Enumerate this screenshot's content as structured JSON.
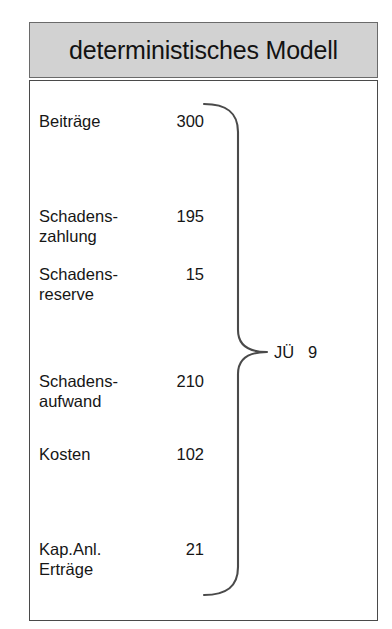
{
  "figure": {
    "title": "deterministisches Modell",
    "colors": {
      "title_bar_bg": "#d2d2d2",
      "panel_bg": "#ffffff",
      "border": "#4a4a4a",
      "text": "#161616",
      "brace": "#444444"
    }
  },
  "rows": [
    {
      "label": "Beiträge",
      "value": "300",
      "y": 110
    },
    {
      "label": "Schadens-\nzahlung",
      "value": "195",
      "y": 205
    },
    {
      "label": "Schadens-\nreserve",
      "value": "15",
      "y": 263
    },
    {
      "label": "Schadens-\naufwand",
      "value": "210",
      "y": 370
    },
    {
      "label": "Kosten",
      "value": "102",
      "y": 443
    },
    {
      "label": "Kap.Anl.\nErträge",
      "value": "21",
      "y": 538
    }
  ],
  "summary": {
    "label": "JÜ",
    "value": "9",
    "text": "JÜ   9"
  },
  "chart_data": {
    "type": "table",
    "title": "deterministisches Modell",
    "categories": [
      "Beiträge",
      "Schadens-zahlung",
      "Schadens-reserve",
      "Schadens-aufwand",
      "Kosten",
      "Kap.Anl. Erträge"
    ],
    "values": [
      300,
      195,
      15,
      210,
      102,
      21
    ],
    "annotations": [
      {
        "label": "JÜ",
        "value": 9
      }
    ],
    "xlabel": "",
    "ylabel": ""
  }
}
